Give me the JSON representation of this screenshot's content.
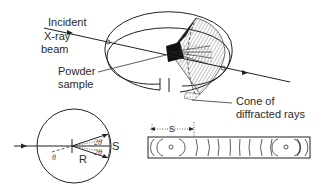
{
  "figure": {
    "labels": {
      "incident_line1": "Incident",
      "incident_line2": "X-ray",
      "incident_line3": "beam",
      "sample_line1": "Powder",
      "sample_line2": "sample",
      "cone_line1": "Cone of",
      "cone_line2": "diffracted rays"
    },
    "geometry": {
      "theta": "θ",
      "two_theta_upper": "2θ",
      "two_theta_lower": "2θ",
      "radius": "R",
      "arc_distance": "S"
    },
    "film": {
      "distance_label": "S",
      "line_count": 12
    }
  }
}
